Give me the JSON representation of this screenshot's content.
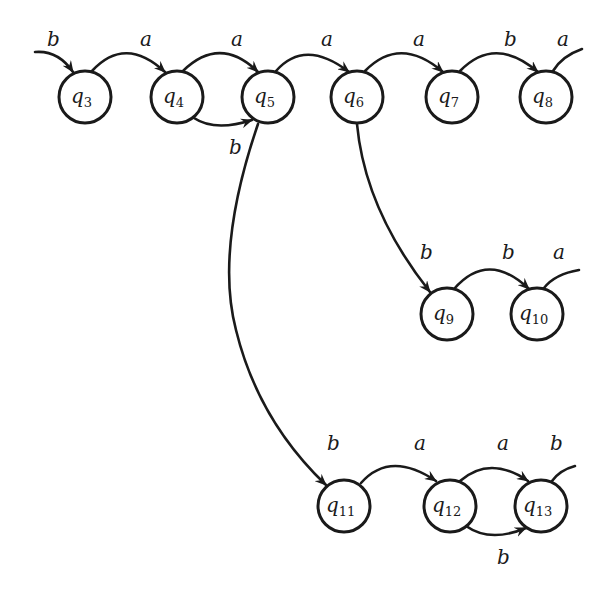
{
  "diagram": {
    "type": "finite-automaton",
    "states": [
      {
        "id": "q3",
        "name": "q",
        "sub": "3",
        "x": 85,
        "y": 97
      },
      {
        "id": "q4",
        "name": "q",
        "sub": "4",
        "x": 177,
        "y": 97
      },
      {
        "id": "q5",
        "name": "q",
        "sub": "5",
        "x": 268,
        "y": 97
      },
      {
        "id": "q6",
        "name": "q",
        "sub": "6",
        "x": 357,
        "y": 97
      },
      {
        "id": "q7",
        "name": "q",
        "sub": "7",
        "x": 452,
        "y": 97
      },
      {
        "id": "q8",
        "name": "q",
        "sub": "8",
        "x": 546,
        "y": 97
      },
      {
        "id": "q9",
        "name": "q",
        "sub": "9",
        "x": 447,
        "y": 314
      },
      {
        "id": "q10",
        "name": "q",
        "sub": "10",
        "x": 537,
        "y": 314
      },
      {
        "id": "q11",
        "name": "q",
        "sub": "11",
        "x": 344,
        "y": 506
      },
      {
        "id": "q12",
        "name": "q",
        "sub": "12",
        "x": 450,
        "y": 506
      },
      {
        "id": "q13",
        "name": "q",
        "sub": "13",
        "x": 541,
        "y": 506
      }
    ],
    "transitions": [
      {
        "from": "in",
        "to": "q3",
        "label": "b"
      },
      {
        "from": "q3",
        "to": "q4",
        "label": "a"
      },
      {
        "from": "q4",
        "to": "q5",
        "label": "a"
      },
      {
        "from": "q4",
        "to": "q5",
        "label": "b"
      },
      {
        "from": "q5",
        "to": "q6",
        "label": "a"
      },
      {
        "from": "q6",
        "to": "q7",
        "label": "a"
      },
      {
        "from": "q7",
        "to": "q8",
        "label": "b"
      },
      {
        "from": "q8",
        "to": "out",
        "label": "a"
      },
      {
        "from": "q6",
        "to": "q9",
        "label": "b"
      },
      {
        "from": "q9",
        "to": "q10",
        "label": "b"
      },
      {
        "from": "q10",
        "to": "out",
        "label": "a"
      },
      {
        "from": "q5",
        "to": "q11",
        "label": "b"
      },
      {
        "from": "q11",
        "to": "q12",
        "label": "a"
      },
      {
        "from": "q12",
        "to": "q13",
        "label": "a"
      },
      {
        "from": "q12",
        "to": "q13",
        "label": "b"
      },
      {
        "from": "q13",
        "to": "out",
        "label": "b"
      }
    ]
  },
  "labels": {
    "in_q3": "b",
    "q3_q4": "a",
    "q4_q5_top": "a",
    "q4_q5_bottom": "b",
    "q5_q6": "a",
    "q6_q7": "a",
    "q7_q8": "b",
    "q8_out": "a",
    "q6_q9": "b",
    "q9_q10": "b",
    "q10_out": "a",
    "q5_q11": "b",
    "q11_q12": "a",
    "q12_q13_top": "a",
    "q12_q13_bottom": "b",
    "q13_out": "b"
  },
  "states": {
    "q3": {
      "name": "q",
      "sub": "3"
    },
    "q4": {
      "name": "q",
      "sub": "4"
    },
    "q5": {
      "name": "q",
      "sub": "5"
    },
    "q6": {
      "name": "q",
      "sub": "6"
    },
    "q7": {
      "name": "q",
      "sub": "7"
    },
    "q8": {
      "name": "q",
      "sub": "8"
    },
    "q9": {
      "name": "q",
      "sub": "9"
    },
    "q10": {
      "name": "q",
      "sub": "10"
    },
    "q11": {
      "name": "q",
      "sub": "11"
    },
    "q12": {
      "name": "q",
      "sub": "12"
    },
    "q13": {
      "name": "q",
      "sub": "13"
    }
  },
  "colors": {
    "stroke": "#1a1a1a",
    "background": "#ffffff"
  }
}
